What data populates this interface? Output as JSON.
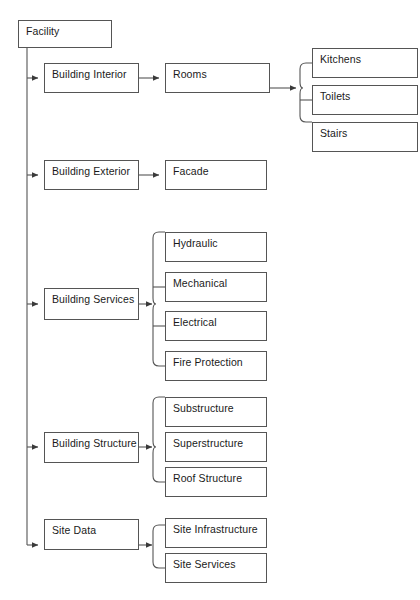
{
  "diagram": {
    "title": "Facility",
    "type": "hierarchical-tree-breakdown",
    "line_color": "#555555",
    "text_color": "#1a1a1a",
    "background_color": "#ffffff",
    "root": {
      "id": "facility",
      "label": "Facility",
      "x": 18,
      "y": 20,
      "w": 94,
      "h": 28
    },
    "level1": [
      {
        "id": "building-interior",
        "label": "Building Interior",
        "x": 44,
        "y": 63,
        "w": 95,
        "h": 30
      },
      {
        "id": "building-exterior",
        "label": "Building Exterior",
        "x": 44,
        "y": 160,
        "w": 95,
        "h": 30
      },
      {
        "id": "building-services",
        "label": "Building Services",
        "x": 44,
        "y": 288,
        "w": 95,
        "h": 32
      },
      {
        "id": "building-structure",
        "label": "Building Structure",
        "x": 44,
        "y": 432,
        "w": 95,
        "h": 31
      },
      {
        "id": "site-data",
        "label": "Site Data",
        "x": 44,
        "y": 519,
        "w": 95,
        "h": 31
      }
    ],
    "level2": [
      {
        "id": "rooms",
        "label": "Rooms",
        "parent": "building-interior",
        "x": 165,
        "y": 63,
        "w": 105,
        "h": 30
      },
      {
        "id": "facade",
        "label": "Facade",
        "parent": "building-exterior",
        "x": 165,
        "y": 160,
        "w": 102,
        "h": 30
      },
      {
        "id": "hydraulic",
        "label": "Hydraulic",
        "parent": "building-services",
        "x": 165,
        "y": 232,
        "w": 102,
        "h": 30
      },
      {
        "id": "mechanical",
        "label": "Mechanical",
        "parent": "building-services",
        "x": 165,
        "y": 272,
        "w": 102,
        "h": 30
      },
      {
        "id": "electrical",
        "label": "Electrical",
        "parent": "building-services",
        "x": 165,
        "y": 311,
        "w": 102,
        "h": 30
      },
      {
        "id": "fire-protection",
        "label": "Fire Protection",
        "parent": "building-services",
        "x": 165,
        "y": 351,
        "w": 102,
        "h": 30
      },
      {
        "id": "substructure",
        "label": "Substructure",
        "parent": "building-structure",
        "x": 165,
        "y": 397,
        "w": 102,
        "h": 30
      },
      {
        "id": "superstructure",
        "label": "Superstructure",
        "parent": "building-structure",
        "x": 165,
        "y": 432,
        "w": 102,
        "h": 30
      },
      {
        "id": "roof-structure",
        "label": "Roof Structure",
        "parent": "building-structure",
        "x": 165,
        "y": 467,
        "w": 102,
        "h": 30
      },
      {
        "id": "site-infrastructure",
        "label": "Site Infrastructure",
        "parent": "site-data",
        "x": 165,
        "y": 518,
        "w": 102,
        "h": 30
      },
      {
        "id": "site-services",
        "label": "Site Services",
        "parent": "site-data",
        "x": 165,
        "y": 553,
        "w": 102,
        "h": 30
      }
    ],
    "level3": [
      {
        "id": "kitchens",
        "label": "Kitchens",
        "parent": "rooms",
        "x": 312,
        "y": 48,
        "w": 106,
        "h": 30
      },
      {
        "id": "toilets",
        "label": "Toilets",
        "parent": "rooms",
        "x": 312,
        "y": 85,
        "w": 106,
        "h": 30
      },
      {
        "id": "stairs",
        "label": "Stairs",
        "parent": "rooms",
        "x": 312,
        "y": 122,
        "w": 106,
        "h": 30
      }
    ]
  }
}
